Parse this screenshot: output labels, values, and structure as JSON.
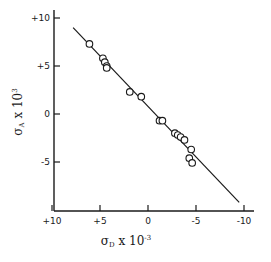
{
  "chart_data": {
    "type": "scatter",
    "title": "",
    "xlabel": "σ_D × 10⁻³",
    "ylabel": "σ_A × 10⁻³",
    "xlim": [
      10,
      -10
    ],
    "ylim": [
      -10,
      10
    ],
    "x_reversed": true,
    "grid": false,
    "legend": null,
    "x_ticks": [
      {
        "value": 10,
        "label": "+10"
      },
      {
        "value": 5,
        "label": "+5"
      },
      {
        "value": 0,
        "label": "0"
      },
      {
        "value": -5,
        "label": "-5"
      },
      {
        "value": -10,
        "label": "-10"
      }
    ],
    "y_ticks": [
      {
        "value": 10,
        "label": "+10"
      },
      {
        "value": 5,
        "label": "+5"
      },
      {
        "value": 0,
        "label": "0"
      },
      {
        "value": -5,
        "label": "-5"
      }
    ],
    "series": [
      {
        "name": "data",
        "marker": "open-circle",
        "points": [
          {
            "x": 6.1,
            "y": 7.3
          },
          {
            "x": 4.7,
            "y": 5.8
          },
          {
            "x": 4.5,
            "y": 5.4
          },
          {
            "x": 4.3,
            "y": 5.0
          },
          {
            "x": 4.3,
            "y": 4.8
          },
          {
            "x": 1.9,
            "y": 2.3
          },
          {
            "x": 0.7,
            "y": 1.8
          },
          {
            "x": -1.2,
            "y": -0.7
          },
          {
            "x": -1.5,
            "y": -0.7
          },
          {
            "x": -2.8,
            "y": -2.0
          },
          {
            "x": -3.1,
            "y": -2.2
          },
          {
            "x": -3.4,
            "y": -2.4
          },
          {
            "x": -3.8,
            "y": -2.7
          },
          {
            "x": -4.5,
            "y": -3.7
          },
          {
            "x": -4.3,
            "y": -4.6
          },
          {
            "x": -4.6,
            "y": -5.1
          }
        ]
      },
      {
        "name": "fit",
        "type": "line",
        "points": [
          {
            "x": 7.8,
            "y": 9.0
          },
          {
            "x": -9.5,
            "y": -9.2
          }
        ]
      }
    ]
  },
  "labels": {
    "x_axis_sigma": "σ",
    "x_axis_sub": "D",
    "x_axis_rest": " x 10",
    "x_axis_exp": "-3",
    "y_axis_sigma": "σ",
    "y_axis_sub": "A",
    "y_axis_rest": " x 10",
    "y_axis_exp": "3"
  }
}
